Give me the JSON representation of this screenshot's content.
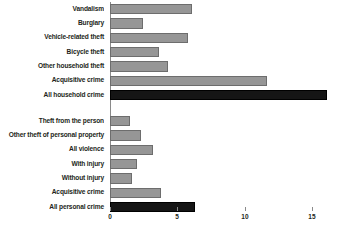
{
  "chart_data": {
    "type": "bar",
    "orientation": "horizontal",
    "title": "",
    "xlabel": "",
    "ylabel": "",
    "xlim": [
      0,
      17.4
    ],
    "xticks": [
      0,
      5,
      10,
      15
    ],
    "xticklabels": [
      "0",
      "5",
      "10",
      "15"
    ],
    "grid": false,
    "legend": false,
    "colors": {
      "bar_gray": "#969696",
      "bar_gray_outline": "#6d6d6d",
      "bar_black": "#151515",
      "axis": "#8a8a8a",
      "text": "#231f20",
      "background": "#ffffff"
    },
    "groups": [
      {
        "name": "household-crime",
        "categories": [
          "Vandalism",
          "Burglary",
          "Vehicle-related theft",
          "Bicycle theft",
          "Other household theft",
          "Acquisitive crime",
          "All household crime"
        ],
        "values": [
          6.1,
          2.5,
          5.8,
          3.7,
          4.3,
          11.7,
          16.1
        ],
        "styles": [
          "gray",
          "gray",
          "gray",
          "gray",
          "gray",
          "gray",
          "black"
        ]
      },
      {
        "name": "personal-crime",
        "categories": [
          "Theft from the person",
          "Other theft of personal property",
          "All violence",
          "With injury",
          "Without injury",
          "Acquisitive crime",
          "All personal crime"
        ],
        "values": [
          1.5,
          2.3,
          3.2,
          2.0,
          1.7,
          3.8,
          6.3
        ],
        "styles": [
          "gray",
          "gray",
          "gray",
          "gray",
          "gray",
          "gray",
          "black"
        ]
      }
    ]
  },
  "layout": {
    "axis_x_px": 109.5,
    "px_per_unit": 13.5,
    "label_right_px": 104,
    "group1_top_px": 4,
    "group2_top_px": 116,
    "row_pitch_px": 14.3,
    "bar_height_px": 10.4,
    "axis_top_px": 2,
    "axis_bottom_px": 207,
    "tick_y_px": 207,
    "ticklabel_y_px": 213
  }
}
